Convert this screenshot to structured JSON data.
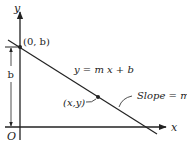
{
  "diagram": {
    "axes": {
      "x_label": "x",
      "y_label": "y",
      "origin_label": "O"
    },
    "line": {
      "equation": "y = m x + b",
      "slope_label": "Slope = m"
    },
    "points": {
      "intercept": "(0, b)",
      "general": "(x,y)"
    },
    "intercept_length_label": "b",
    "colors": {
      "ink": "#222222",
      "background": "#ffffff"
    }
  }
}
